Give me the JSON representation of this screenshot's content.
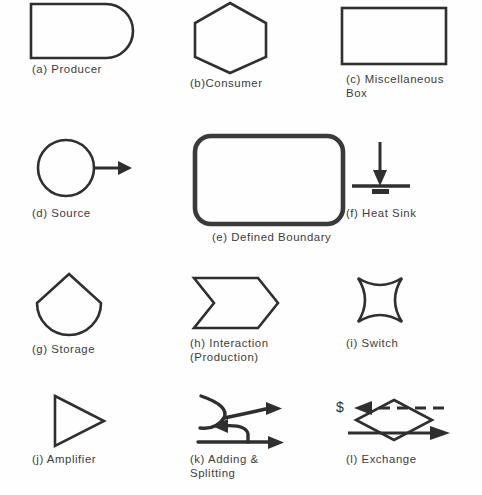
{
  "diagram": {
    "background_color": "#fefefe",
    "stroke_color": "#2f2f2f",
    "rows": [
      {
        "cells": [
          {
            "key": "producer",
            "icon": "producer-bullet-shape",
            "label": "(a) Producer"
          },
          {
            "key": "consumer",
            "icon": "consumer-hexagon-shape",
            "label": "(b)Consumer"
          },
          {
            "key": "miscellaneous_box",
            "icon": "miscellaneous-rectangle-shape",
            "label": "(c) Miscellaneous\n     Box"
          }
        ]
      },
      {
        "cells": [
          {
            "key": "source",
            "icon": "source-circle-arrow-shape",
            "label": "(d) Source"
          },
          {
            "key": "defined_boundary",
            "icon": "defined-boundary-rounded-rect-shape",
            "label": "(e) Defined Boundary"
          },
          {
            "key": "heat_sink",
            "icon": "heat-sink-ground-arrow-shape",
            "label": "(f) Heat Sink"
          }
        ]
      },
      {
        "cells": [
          {
            "key": "storage",
            "icon": "storage-tank-shape",
            "label": "(g) Storage"
          },
          {
            "key": "interaction",
            "icon": "interaction-chevron-shape",
            "label": "(h) Interaction\n      (Production)"
          },
          {
            "key": "switch",
            "icon": "switch-concave-square-shape",
            "label": "(i) Switch"
          }
        ]
      },
      {
        "cells": [
          {
            "key": "amplifier",
            "icon": "amplifier-triangle-shape",
            "label": "(j) Amplifier"
          },
          {
            "key": "adding_and_splitting",
            "icon": "adding-splitting-arrows-shape",
            "label": "(k) Adding &\n      Splitting"
          },
          {
            "key": "exchange",
            "icon": "exchange-diamond-shape",
            "label": "(l) Exchange"
          }
        ]
      }
    ],
    "exchange_money_symbol": "$"
  }
}
